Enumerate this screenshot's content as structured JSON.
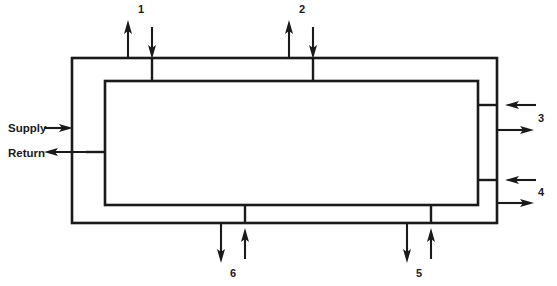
{
  "diagram": {
    "stroke_color": "#1a1a1a",
    "background_color": "#ffffff",
    "outer_loop": {
      "name": "supply-loop",
      "x": 72,
      "y": 58,
      "width": 425,
      "height": 165
    },
    "inner_loop": {
      "name": "return-loop",
      "x": 105,
      "y": 81,
      "width": 373,
      "height": 124
    },
    "side_labels": [
      {
        "id": "supply",
        "text": "Supply",
        "x": 8,
        "y": 132
      },
      {
        "id": "return",
        "text": "Return",
        "x": 8,
        "y": 157
      }
    ],
    "ports": [
      {
        "id": "port-1",
        "label": "1",
        "label_x": 141,
        "label_y": 13,
        "side": "top",
        "out_arrow_x": 128,
        "in_arrow_x": 152,
        "stub_x": 152
      },
      {
        "id": "port-2",
        "label": "2",
        "label_x": 302,
        "label_y": 13,
        "side": "top",
        "out_arrow_x": 289,
        "in_arrow_x": 313,
        "stub_x": 313
      },
      {
        "id": "port-3",
        "label": "3",
        "label_x": 541,
        "label_y": 122,
        "side": "right",
        "in_arrow_y": 105,
        "out_arrow_y": 130,
        "stub_y": 105
      },
      {
        "id": "port-4",
        "label": "4",
        "label_x": 541,
        "label_y": 196,
        "side": "right",
        "in_arrow_y": 180,
        "out_arrow_y": 203,
        "stub_y": 180
      },
      {
        "id": "port-5",
        "label": "5",
        "label_x": 419,
        "label_y": 277,
        "side": "bottom",
        "out_arrow_x": 407,
        "in_arrow_x": 431,
        "stub_x": 431
      },
      {
        "id": "port-6",
        "label": "6",
        "label_x": 233,
        "label_y": 277,
        "side": "bottom",
        "out_arrow_x": 221,
        "in_arrow_x": 245,
        "stub_x": 245
      }
    ],
    "supply_arrow": {
      "name": "supply-inlet-arrow",
      "direction": "right",
      "x1": 44,
      "x2": 72,
      "y": 128
    },
    "return_arrow": {
      "name": "return-outlet-arrow",
      "direction": "left",
      "x1": 105,
      "x2": 44,
      "y": 152
    }
  }
}
